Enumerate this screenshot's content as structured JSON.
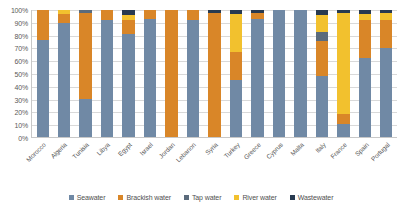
{
  "chart_data": {
    "type": "bar",
    "stacked": true,
    "stack_mode": "percent",
    "title": "",
    "subtitle": "",
    "xlabel": "",
    "ylabel": "",
    "ylim": [
      0,
      100
    ],
    "grid": true,
    "legend_position": "bottom",
    "y_ticks": [
      "0%",
      "10%",
      "20%",
      "30%",
      "40%",
      "50%",
      "60%",
      "70%",
      "80%",
      "90%",
      "100%"
    ],
    "y_tick_values": [
      0,
      10,
      20,
      30,
      40,
      50,
      60,
      70,
      80,
      90,
      100
    ],
    "categories": [
      "Morocco",
      "Algeria",
      "Tunisia",
      "Libya",
      "Egypt",
      "Israel",
      "Jordan",
      "Lebanon",
      "Syria",
      "Turkey",
      "Greece",
      "Cyprus",
      "Malta",
      "Italy",
      "France",
      "Spain",
      "Portugal"
    ],
    "series": [
      {
        "name": "Seawater",
        "color": "#7089a5",
        "values": [
          76,
          90,
          30,
          92,
          81,
          93,
          0,
          92,
          0,
          45,
          93,
          100,
          100,
          48,
          10,
          62,
          70
        ]
      },
      {
        "name": "Brackish water",
        "color": "#d98628",
        "values": [
          24,
          7,
          68,
          8,
          11,
          7,
          100,
          8,
          98,
          22,
          5,
          0,
          0,
          28,
          8,
          30,
          22
        ]
      },
      {
        "name": "Tap water",
        "color": "#5b6b7c",
        "values": [
          0,
          0,
          2,
          0,
          0,
          0,
          0,
          0,
          0,
          0,
          0,
          0,
          0,
          7,
          0,
          0,
          0
        ]
      },
      {
        "name": "River water",
        "color": "#f2c12e",
        "values": [
          0,
          3,
          0,
          0,
          4,
          0,
          0,
          0,
          0,
          30,
          0,
          0,
          0,
          13,
          80,
          5,
          6
        ]
      },
      {
        "name": "Wastewater",
        "color": "#283a50",
        "values": [
          0,
          0,
          0,
          0,
          4,
          0,
          0,
          0,
          2,
          3,
          2,
          0,
          0,
          4,
          2,
          3,
          2
        ]
      }
    ]
  },
  "legend": {
    "items": [
      {
        "label": "Seawater",
        "color": "#7089a5"
      },
      {
        "label": "Brackish water",
        "color": "#d98628"
      },
      {
        "label": "Tap water",
        "color": "#5b6b7c"
      },
      {
        "label": "River water",
        "color": "#f2c12e"
      },
      {
        "label": "Wastewater",
        "color": "#283a50"
      }
    ]
  }
}
